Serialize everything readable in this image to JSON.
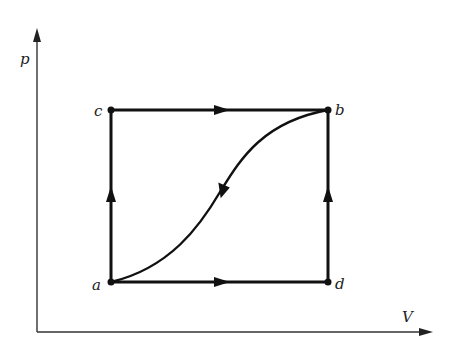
{
  "diagram": {
    "type": "pV-diagram",
    "axes": {
      "y_label": "p",
      "x_label": "V"
    },
    "points": [
      {
        "id": "a",
        "label": "a"
      },
      {
        "id": "b",
        "label": "b"
      },
      {
        "id": "c",
        "label": "c"
      },
      {
        "id": "d",
        "label": "d"
      }
    ],
    "paths": [
      {
        "from": "a",
        "to": "c",
        "shape": "straight",
        "direction": "up"
      },
      {
        "from": "c",
        "to": "b",
        "shape": "straight",
        "direction": "right"
      },
      {
        "from": "a",
        "to": "d",
        "shape": "straight",
        "direction": "right"
      },
      {
        "from": "d",
        "to": "b",
        "shape": "straight",
        "direction": "up"
      },
      {
        "from": "b",
        "to": "a",
        "shape": "curve",
        "direction": "down-left"
      }
    ],
    "colors": {
      "line": "#111111",
      "axis": "#333333",
      "background": "#ffffff"
    }
  }
}
